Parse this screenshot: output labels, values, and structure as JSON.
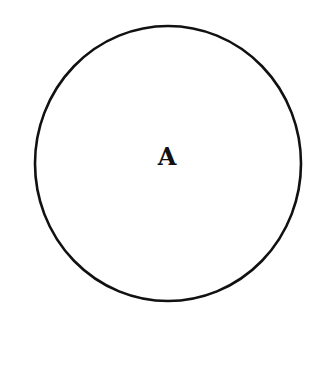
{
  "diagram": {
    "type": "venn-single-set",
    "sets": [
      {
        "label": "A",
        "shape": "circle",
        "center": [
          168,
          163
        ],
        "radius_x": 133,
        "radius_y": 138,
        "stroke_color": "#111111",
        "fill_color": "none"
      }
    ],
    "background_color": "#ffffff"
  }
}
